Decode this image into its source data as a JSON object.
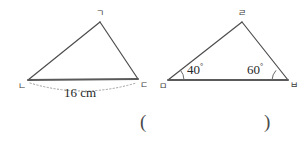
{
  "figure": {
    "kind": "geometry-problem-figure",
    "background_color": "#ffffff",
    "stroke_color": "#4d4d4d",
    "base_stroke_color": "#5a5a5a",
    "dotted_color": "#9a9a9a",
    "text_color": "#282828",
    "triangles": [
      {
        "id": "triangle-left",
        "name": "triangle-gnd",
        "vertices": [
          {
            "id": "apex",
            "label": "ㄱ",
            "x": 100,
            "y": 22,
            "label_x": 96,
            "label_y": 9
          },
          {
            "id": "bottom-left",
            "label": "ㄴ",
            "x": 28,
            "y": 80,
            "label_x": 18,
            "label_y": 82
          },
          {
            "id": "bottom-right",
            "label": "ㄷ",
            "x": 138,
            "y": 79,
            "label_x": 140,
            "label_y": 81
          }
        ],
        "measure": {
          "label": "16 cm",
          "label_x": 64,
          "label_y": 86,
          "arc_style": "dotted",
          "arc_from_x": 30,
          "arc_to_x": 136,
          "arc_y": 82,
          "arc_dip_y": 96
        },
        "angles": []
      },
      {
        "id": "triangle-right",
        "name": "triangle-rmb",
        "vertices": [
          {
            "id": "apex",
            "label": "ㄹ",
            "x": 242,
            "y": 22,
            "label_x": 238,
            "label_y": 9
          },
          {
            "id": "bottom-left",
            "label": "ㅁ",
            "x": 168,
            "y": 80,
            "label_x": 159,
            "label_y": 82
          },
          {
            "id": "bottom-right",
            "label": "ㅂ",
            "x": 288,
            "y": 80,
            "label_x": 290,
            "label_y": 81
          }
        ],
        "measure": null,
        "angles": [
          {
            "id": "angle-m",
            "at_vertex": "bottom-left",
            "value": "40",
            "unit": "°",
            "label_x": 187,
            "label_y": 63,
            "arc_cx": 168,
            "arc_cy": 80,
            "arc_r": 16
          },
          {
            "id": "angle-b",
            "at_vertex": "bottom-right",
            "value": "60",
            "unit": "°",
            "label_x": 247,
            "label_y": 63,
            "arc_cx": 288,
            "arc_cy": 80,
            "arc_r": 16
          }
        ]
      }
    ],
    "answer_blank": {
      "open_paren": "(",
      "close_paren": ")",
      "value": "",
      "open_x": 140,
      "close_x": 264,
      "y": 112
    }
  }
}
